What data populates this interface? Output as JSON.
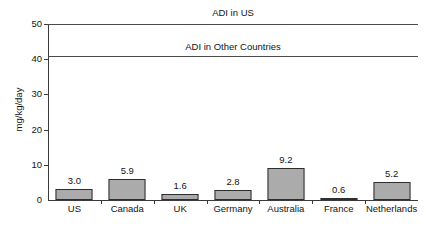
{
  "chart_data": {
    "type": "bar",
    "title": "",
    "xlabel": "",
    "ylabel": "mg/kg/day",
    "ylim": [
      0,
      50
    ],
    "yticks": [
      0,
      10,
      20,
      30,
      40,
      50
    ],
    "ytick_labels": [
      "0",
      "10",
      "20",
      "30",
      "40",
      "50"
    ],
    "grid": false,
    "legend": "none",
    "categories": [
      "US",
      "Canada",
      "UK",
      "Germany",
      "Australia",
      "France",
      "Netherlands"
    ],
    "values": [
      3.0,
      5.9,
      1.6,
      2.8,
      9.2,
      0.6,
      5.2
    ],
    "value_labels": [
      "3.0",
      "5.9",
      "1.6",
      "2.8",
      "9.2",
      "0.6",
      "5.2"
    ],
    "reference_lines": [
      {
        "label": "ADI in US",
        "value": 50,
        "label_position": "above"
      },
      {
        "label": "ADI in Other Countries",
        "value": 41,
        "label_position": "above"
      }
    ],
    "bar_fill_color": "#ababab",
    "bar_border_color": "#2e2e2e",
    "axis_color": "#3a3a3a",
    "background_color": "#ffffff"
  }
}
